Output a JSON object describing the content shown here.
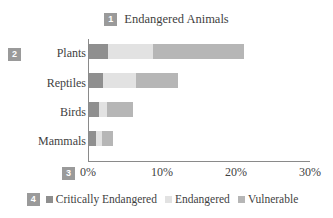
{
  "chart_data": {
    "type": "bar",
    "orientation": "horizontal",
    "stacked": true,
    "title": "Endangered Animals",
    "xlabel": "",
    "ylabel": "",
    "categories": [
      "Mammals",
      "Birds",
      "Reptiles",
      "Plants"
    ],
    "series": [
      {
        "name": "Critically Endangered",
        "color": "#8f8f8f",
        "values": [
          0.9,
          1.3,
          1.9,
          2.5
        ]
      },
      {
        "name": "Endangered",
        "color": "#e2e2e2",
        "values": [
          0.9,
          1.2,
          4.5,
          6.2
        ]
      },
      {
        "name": "Vulnerable",
        "color": "#b6b6b6",
        "values": [
          1.4,
          3.5,
          5.6,
          12.2
        ]
      }
    ],
    "xlim": [
      0,
      30
    ],
    "x_ticks": [
      "0%",
      "10%",
      "20%",
      "30%"
    ],
    "x_tick_values": [
      0,
      10,
      20,
      30
    ],
    "grid": false,
    "legend_position": "bottom"
  },
  "annotations": {
    "title_badge": "1",
    "category_badge": "2",
    "axis_badge": "3",
    "legend_badge": "4"
  },
  "colors": {
    "critically_endangered": "#8f8f8f",
    "endangered": "#e2e2e2",
    "vulnerable": "#b6b6b6",
    "badge": "#9a9a9a",
    "axis": "#8a8a8a",
    "text": "#3f3f3f"
  }
}
